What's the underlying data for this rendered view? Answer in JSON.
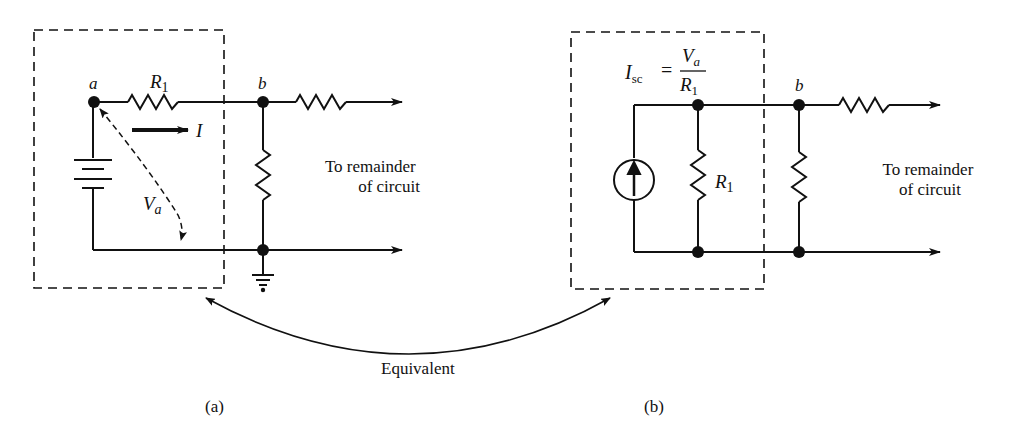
{
  "figure": {
    "panel_a": {
      "caption": "(a)",
      "node_a": "a",
      "node_b": "b",
      "resistor_label": "R",
      "resistor_sub": "1",
      "current_label": "I",
      "voltage_label": "V",
      "voltage_sub": "a",
      "remainder_line1": "To remainder",
      "remainder_line2": "of circuit"
    },
    "panel_b": {
      "caption": "(b)",
      "node_b": "b",
      "formula_lhs": "I",
      "formula_lhs_sub": "sc",
      "formula_eq": "=",
      "formula_num": "V",
      "formula_num_sub": "a",
      "formula_den": "R",
      "formula_den_sub": "1",
      "resistor_label": "R",
      "resistor_sub": "1",
      "remainder_line1": "To remainder",
      "remainder_line2": "of circuit"
    },
    "equivalence_label": "Equivalent"
  }
}
